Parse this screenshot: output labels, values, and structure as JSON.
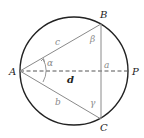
{
  "diagram": {
    "points": {
      "A": "A",
      "B": "B",
      "C": "C",
      "P": "P"
    },
    "sides": {
      "a": "a",
      "b": "b",
      "c": "c"
    },
    "diameter_label": "d",
    "angles": {
      "alpha": "α",
      "beta": "β",
      "gamma": "γ"
    },
    "colors": {
      "circle": "#222222",
      "triangle": "#8a8a8a",
      "diameter": "#555555",
      "labels": "#222222",
      "side_labels": "#8a8a8a"
    }
  }
}
